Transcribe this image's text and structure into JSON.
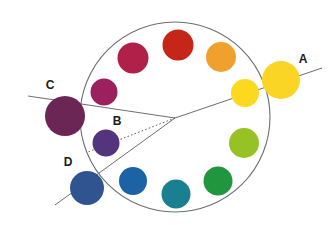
{
  "figure": {
    "background": "#ffffff",
    "width": 335,
    "height": 225
  },
  "wheel": {
    "center_x": 175,
    "center_y": 117,
    "radius": 95,
    "stroke_color": "#6b6f73",
    "stroke_width": 1.0,
    "fill": "none"
  },
  "vertex": {
    "x": 175,
    "y": 118,
    "description": "common origin point of the radial lines"
  },
  "labels": [
    {
      "id": "A",
      "text": "A",
      "x": 303,
      "y": 63
    },
    {
      "id": "B",
      "text": "B",
      "x": 117,
      "y": 125
    },
    {
      "id": "C",
      "text": "C",
      "x": 50,
      "y": 89
    },
    {
      "id": "D",
      "text": "D",
      "x": 68,
      "y": 166
    }
  ],
  "lines": [
    {
      "id": "line-a",
      "from_x": 175,
      "from_y": 118,
      "to_x": 322,
      "to_y": 68,
      "style": "solid",
      "color": "#6b6f73",
      "width": 1.0,
      "label": "A"
    },
    {
      "id": "line-b",
      "from_x": 175,
      "from_y": 118,
      "to_x": 88,
      "to_y": 152,
      "style": "dotted",
      "color": "#5a5e62",
      "width": 1.0,
      "label": "B"
    },
    {
      "id": "line-c",
      "from_x": 175,
      "from_y": 118,
      "to_x": 28,
      "to_y": 96,
      "style": "solid",
      "color": "#6b6f73",
      "width": 1.0,
      "label": "C"
    },
    {
      "id": "line-d",
      "from_x": 175,
      "from_y": 118,
      "to_x": 55,
      "to_y": 205,
      "style": "solid",
      "color": "#6b6f73",
      "width": 1.0,
      "label": "D"
    }
  ],
  "chart_data": {
    "type": "scatter",
    "xlabel": "",
    "ylabel": "",
    "points": [
      {
        "name": "dark-red",
        "label": "",
        "color": "#c52617",
        "x": 178,
        "y": 45,
        "r": 15.5,
        "inside_wheel": true
      },
      {
        "name": "crimson",
        "label": "",
        "color": "#b02048",
        "x": 133,
        "y": 58,
        "r": 15.5,
        "inside_wheel": true
      },
      {
        "name": "magenta-purple",
        "label": "",
        "color": "#9c1f5e",
        "x": 104,
        "y": 92,
        "r": 13.5,
        "inside_wheel": true
      },
      {
        "name": "purple",
        "label": "B",
        "color": "#54347c",
        "x": 106,
        "y": 143,
        "r": 13.5,
        "inside_wheel": true
      },
      {
        "name": "dark-blue",
        "label": "D",
        "color": "#2f5490",
        "x": 87,
        "y": 188,
        "r": 17.0,
        "inside_wheel": false
      },
      {
        "name": "blue",
        "label": "",
        "color": "#1c63a5",
        "x": 133,
        "y": 181,
        "r": 14.0,
        "inside_wheel": true
      },
      {
        "name": "teal",
        "label": "",
        "color": "#1a7f91",
        "x": 176,
        "y": 194,
        "r": 14.5,
        "inside_wheel": true
      },
      {
        "name": "green",
        "label": "",
        "color": "#22963f",
        "x": 218,
        "y": 181,
        "r": 14.5,
        "inside_wheel": true
      },
      {
        "name": "yellow-green",
        "label": "",
        "color": "#96c226",
        "x": 244,
        "y": 143,
        "r": 15.0,
        "inside_wheel": true
      },
      {
        "name": "yellow",
        "label": "",
        "color": "#fcd81e",
        "x": 245,
        "y": 93,
        "r": 14.0,
        "inside_wheel": true
      },
      {
        "name": "yellow-large",
        "label": "A",
        "color": "#fbd526",
        "x": 281,
        "y": 80,
        "r": 19.0,
        "inside_wheel": false
      },
      {
        "name": "orange",
        "label": "",
        "color": "#f0a02c",
        "x": 221,
        "y": 57,
        "r": 15.0,
        "inside_wheel": true
      },
      {
        "name": "dark-purple",
        "label": "C",
        "color": "#6b2655",
        "x": 65,
        "y": 116,
        "r": 20.0,
        "inside_wheel": false
      }
    ],
    "legend_position": "none",
    "grid": false
  }
}
